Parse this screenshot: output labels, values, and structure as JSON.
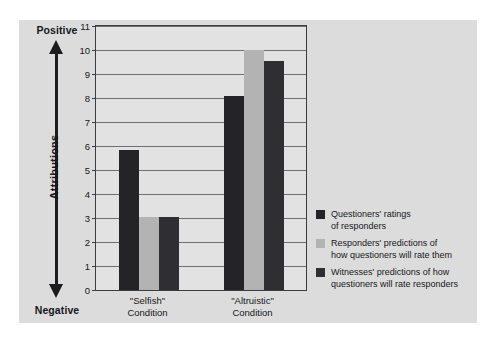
{
  "chart_data": {
    "type": "bar",
    "title": "",
    "xlabel": "",
    "ylabel": "Attributions",
    "ylim": [
      0,
      11
    ],
    "ytick_labels": [
      "11",
      "10",
      "9",
      "8",
      "7",
      "6",
      "5",
      "4",
      "3",
      "2",
      "1",
      "0"
    ],
    "grid": true,
    "legend_position": "right",
    "categories": [
      "\"Selfish\"\nCondition",
      "\"Altruistic\"\nCondition"
    ],
    "series": [
      {
        "name": "Questioners' ratings of responders",
        "color": "#242428",
        "values": [
          5.85,
          8.1
        ]
      },
      {
        "name": "Responders' predictions of how questioners will rate them",
        "color": "#b3b3b3",
        "values": [
          3.05,
          10.0
        ]
      },
      {
        "name": "Witnesses' predictions of how questioners will rate responders",
        "color": "#2f2f33",
        "values": [
          3.05,
          9.55
        ]
      }
    ],
    "axis_anchor_top": "Positive",
    "axis_anchor_bottom": "Negative"
  },
  "axis": {
    "top_label": "Positive",
    "bottom_label": "Negative",
    "vertical_label": "Attributions"
  },
  "xaxis": {
    "groups": [
      {
        "line1": "\"Selfish\"",
        "line2": "Condition"
      },
      {
        "line1": "\"Altruistic\"",
        "line2": "Condition"
      }
    ]
  },
  "legend": {
    "items": [
      {
        "swatch": "#242428",
        "label": "Questioners' ratings\nof responders"
      },
      {
        "swatch": "#b3b3b3",
        "label": "Responders' predictions of\nhow questioners will rate them"
      },
      {
        "swatch": "#2f2f33",
        "label": "Witnesses' predictions of how\nquestioners will rate responders"
      }
    ]
  },
  "colors": {
    "panel_background": "#dcdcdc",
    "plot_background": "#e2e2e2",
    "gridline": "#6d6d72",
    "frame": "#3c3c40",
    "text": "#17171b"
  }
}
